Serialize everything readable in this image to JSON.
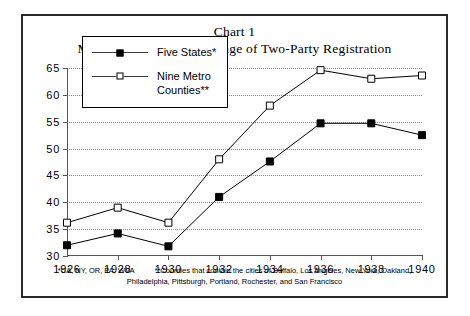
{
  "figure": {
    "title_line1": "Chart 1",
    "title_line2": "Mean Democratic Percentage of Two-Party Registration"
  },
  "legend": {
    "items": [
      {
        "label": "Five States*",
        "marker": "filled-square-marker",
        "color": "#000000"
      },
      {
        "label": "Nine Metro\nCounties**",
        "marker": "open-square-marker",
        "color": "#000000"
      }
    ]
  },
  "footnotes": {
    "note1": "*CA, NY, OR, PA, WVA",
    "note2_line1": "**Counties that contain the cities of Buffalo, Los Angeles, New York, Oakland,",
    "note2_line2": "Philadelphia, Pittsburgh, Portland, Rochester, and San Francisco"
  },
  "chart_data": {
    "type": "line",
    "xlabel": "",
    "ylabel": "",
    "x": [
      1926,
      1928,
      1930,
      1932,
      1934,
      1936,
      1938,
      1940
    ],
    "xtick_labels": [
      "1926",
      "1928",
      "1930",
      "1932",
      "1934",
      "1936",
      "1938",
      "1940"
    ],
    "ytick_labels": [
      "30",
      "35",
      "40",
      "45",
      "50",
      "55",
      "60",
      "65"
    ],
    "yticks": [
      30,
      35,
      40,
      45,
      50,
      55,
      60,
      65
    ],
    "xlim": [
      1926,
      1940
    ],
    "ylim": [
      30,
      65
    ],
    "grid": true,
    "legend_position": "upper-left-inside",
    "series": [
      {
        "name": "Five States*",
        "marker": "filled-square",
        "color": "#000000",
        "values": [
          32.0,
          34.2,
          31.8,
          41.0,
          47.6,
          54.7,
          54.7,
          52.5
        ]
      },
      {
        "name": "Nine Metro Counties**",
        "marker": "open-square",
        "color": "#000000",
        "values": [
          36.2,
          39.0,
          36.2,
          48.0,
          58.0,
          64.6,
          63.0,
          63.6
        ]
      }
    ]
  }
}
